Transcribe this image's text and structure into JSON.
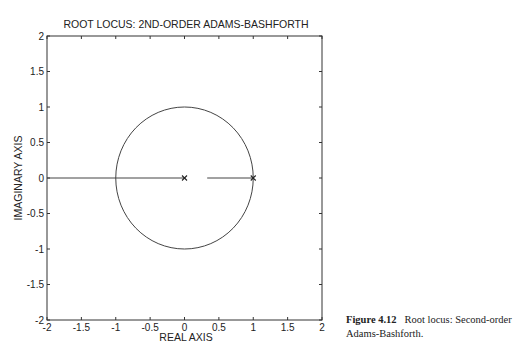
{
  "chart_data": {
    "type": "line",
    "title": "ROOT LOCUS:  2ND-ORDER  ADAMS-BASHFORTH",
    "xlabel": "REAL AXIS",
    "ylabel": "IMAGINARY AXIS",
    "xlim": [
      -2,
      2
    ],
    "ylim": [
      -2,
      2
    ],
    "xticks": [
      -2,
      -1.5,
      -1,
      -0.5,
      0,
      0.5,
      1,
      1.5,
      2
    ],
    "yticks": [
      -2,
      -1.5,
      -1,
      -0.5,
      0,
      0.5,
      1,
      1.5,
      2
    ],
    "xtick_labels": [
      "-2",
      "-1.5",
      "-1",
      "-0.5",
      "0",
      "0.5",
      "1",
      "1.5",
      "2"
    ],
    "ytick_labels": [
      "-2",
      "-1.5",
      "-1",
      "-0.5",
      "0",
      "0.5",
      "1",
      "1.5",
      "2"
    ],
    "grid": false,
    "series": [
      {
        "name": "unit circle",
        "kind": "circle",
        "center": [
          0,
          0
        ],
        "radius": 1
      },
      {
        "name": "locus branch left",
        "kind": "segment",
        "x": [
          -2,
          0
        ],
        "y": [
          0,
          0
        ]
      },
      {
        "name": "locus branch right",
        "kind": "segment",
        "x": [
          0.33,
          1
        ],
        "y": [
          0,
          0
        ]
      },
      {
        "name": "poles",
        "kind": "markers",
        "marker": "x",
        "x": [
          0,
          1
        ],
        "y": [
          0,
          0
        ]
      }
    ]
  },
  "caption": {
    "label": "Figure 4.12",
    "text": "Root locus: Second-order Adams-Bashforth."
  }
}
